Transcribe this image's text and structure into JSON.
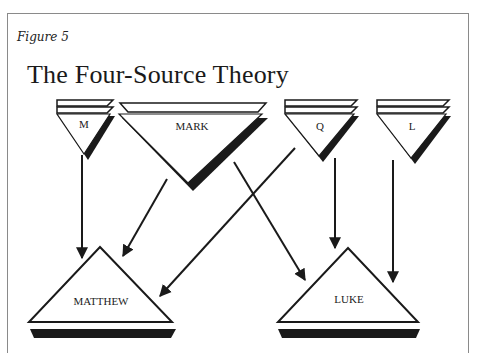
{
  "figure": {
    "label": "Figure 5",
    "title": "The Four-Source Theory"
  },
  "sources": [
    {
      "id": "M",
      "label": "M"
    },
    {
      "id": "MARK",
      "label": "MARK"
    },
    {
      "id": "Q",
      "label": "Q"
    },
    {
      "id": "L",
      "label": "L"
    }
  ],
  "gospels": [
    {
      "id": "MATTHEW",
      "label": "MATTHEW"
    },
    {
      "id": "LUKE",
      "label": "LUKE"
    }
  ],
  "edges": [
    {
      "from": "M",
      "to": "MATTHEW"
    },
    {
      "from": "MARK",
      "to": "MATTHEW"
    },
    {
      "from": "Q",
      "to": "MATTHEW"
    },
    {
      "from": "MARK",
      "to": "LUKE"
    },
    {
      "from": "Q",
      "to": "LUKE"
    },
    {
      "from": "L",
      "to": "LUKE"
    }
  ],
  "colors": {
    "ink": "#1a1a1a",
    "frame": "#8a8a8a",
    "background": "#ffffff"
  }
}
